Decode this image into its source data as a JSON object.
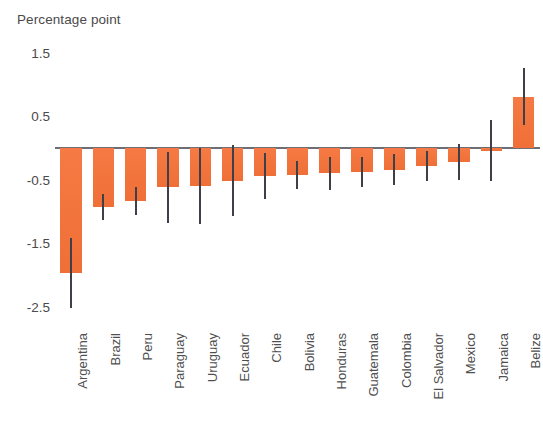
{
  "chart_data": {
    "type": "bar",
    "title": "",
    "ylabel": "Percentage point",
    "xlabel": "",
    "ylim": [
      -2.9,
      1.6
    ],
    "grid": false,
    "legend": null,
    "yticks": [
      1.5,
      0.5,
      -0.5,
      -1.5,
      -2.5
    ],
    "ytick_labels": [
      "1.5",
      "0.5",
      "-0.5",
      "-1.5",
      "-2.5"
    ],
    "zero_line": 0,
    "bar_color": "#f4743b",
    "error_bar_color": "#3f3f48",
    "categories": [
      "Argentina",
      "Brazil",
      "Peru",
      "Paraguay",
      "Uruguay",
      "Ecuador",
      "Chile",
      "Bolivia",
      "Honduras",
      "Guatemala",
      "Colombia",
      "El Salvador",
      "Mexico",
      "Jamaica",
      "Belize"
    ],
    "values": [
      -1.97,
      -0.93,
      -0.83,
      -0.62,
      -0.6,
      -0.52,
      -0.44,
      -0.42,
      -0.4,
      -0.38,
      -0.34,
      -0.28,
      -0.22,
      -0.04,
      0.8
    ],
    "error_low": [
      -2.52,
      -1.13,
      -1.05,
      -1.18,
      -1.2,
      -1.08,
      -0.8,
      -0.64,
      -0.66,
      -0.62,
      -0.58,
      -0.52,
      -0.5,
      -0.52,
      0.36
    ],
    "error_high": [
      -1.42,
      -0.73,
      -0.61,
      -0.06,
      0.0,
      0.04,
      -0.08,
      -0.2,
      -0.14,
      -0.14,
      -0.1,
      -0.04,
      0.06,
      0.44,
      1.26
    ]
  }
}
